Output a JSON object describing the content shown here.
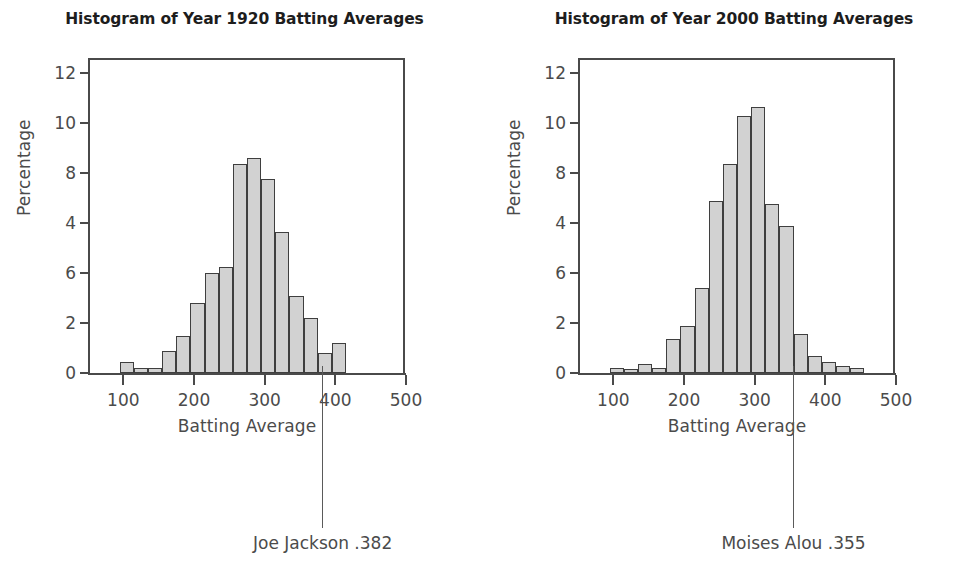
{
  "chart_data": [
    {
      "type": "bar",
      "title": "Histogram of Year 1920 Batting Averages",
      "xlabel": "Batting Average",
      "ylabel": "Percentage",
      "xlim": [
        50,
        500
      ],
      "ylim": [
        0,
        12.6
      ],
      "grid": false,
      "legend": null,
      "xticks": [
        100,
        200,
        300,
        400,
        500
      ],
      "yticks": [
        12,
        10,
        8,
        4,
        6,
        2,
        0
      ],
      "ytick_positions": [
        12,
        10,
        8,
        6,
        4,
        2,
        0
      ],
      "bin_width": 20,
      "bin_starts": [
        95,
        115,
        135,
        155,
        175,
        195,
        215,
        235,
        255,
        275,
        295,
        315,
        335,
        355,
        375,
        395
      ],
      "categories": [
        "95-115",
        "115-135",
        "135-155",
        "155-175",
        "175-195",
        "195-215",
        "215-235",
        "235-255",
        "255-275",
        "275-295",
        "295-315",
        "315-335",
        "335-355",
        "355-375",
        "375-395",
        "395-415"
      ],
      "values": [
        0.45,
        0.2,
        0.2,
        0.9,
        1.5,
        2.8,
        4.0,
        4.25,
        8.35,
        8.6,
        7.75,
        5.65,
        3.1,
        2.2,
        0.8,
        1.2
      ],
      "annotation": {
        "label": "Joe Jackson .382",
        "value": 382
      }
    },
    {
      "type": "bar",
      "title": "Histogram of Year 2000 Batting Averages",
      "xlabel": "Batting Average",
      "ylabel": "Percentage",
      "xlim": [
        50,
        500
      ],
      "ylim": [
        0,
        12.6
      ],
      "grid": false,
      "legend": null,
      "xticks": [
        100,
        200,
        300,
        400,
        500
      ],
      "yticks": [
        12,
        10,
        8,
        4,
        6,
        2,
        0
      ],
      "ytick_positions": [
        12,
        10,
        8,
        6,
        4,
        2,
        0
      ],
      "bin_width": 20,
      "bin_starts": [
        95,
        115,
        135,
        155,
        175,
        195,
        215,
        235,
        255,
        275,
        295,
        315,
        335,
        355,
        375,
        395
      ],
      "categories": [
        "95-115",
        "115-135",
        "135-155",
        "155-175",
        "175-195",
        "195-215",
        "215-235",
        "235-255",
        "255-275",
        "275-295",
        "295-315",
        "315-335",
        "335-355",
        "355-375",
        "375-395",
        "395-415"
      ],
      "values": [
        0.2,
        0.15,
        0.35,
        0.2,
        1.35,
        1.9,
        3.4,
        6.9,
        8.35,
        10.3,
        10.65,
        6.75,
        5.9,
        1.55,
        0.7,
        0.45
      ],
      "extra_values": [
        0.3,
        0.2
      ],
      "annotation": {
        "label": "Moises Alou .355",
        "value": 355
      }
    }
  ],
  "style": {
    "bar_fill": "#d2d2d2",
    "bar_stroke": "#3f3f3f",
    "axis_color": "#4a4a4a",
    "text_color": "#4b4b4b",
    "title_color": "#1d1d1d",
    "background": "#ffffff"
  }
}
